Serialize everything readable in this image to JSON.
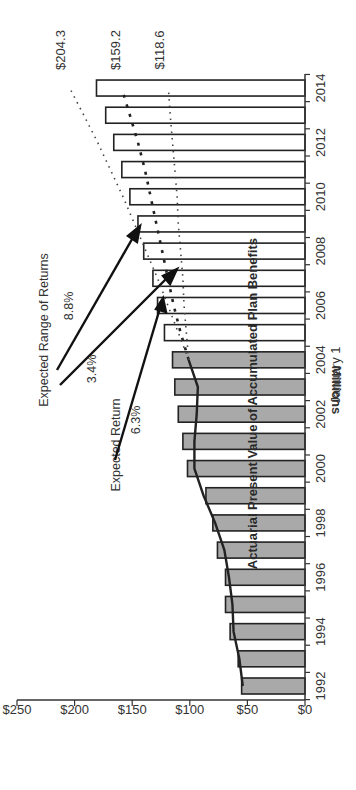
{
  "chart_data": {
    "type": "bar",
    "orientation": "rotated-90-ccw",
    "title": "",
    "xlabel": "January 1",
    "ylabel": "Millions",
    "ylim": [
      0,
      250
    ],
    "yticks": [
      "$0",
      "$50",
      "$100",
      "$150",
      "$200",
      "$250"
    ],
    "ytick_values": [
      0,
      50,
      100,
      150,
      200,
      250
    ],
    "xticks": [
      "1992",
      "1994",
      "1996",
      "1998",
      "2000",
      "2002",
      "2004",
      "2006",
      "2008",
      "2010",
      "2012",
      "2014"
    ],
    "categories": [
      1992,
      1993,
      1994,
      1995,
      1996,
      1997,
      1998,
      1999,
      2000,
      2001,
      2002,
      2003,
      2004,
      2005,
      2006,
      2007,
      2008,
      2009,
      2010,
      2011,
      2012,
      2013,
      2014
    ],
    "series": [
      {
        "name": "Assets (actual)",
        "style": "gray-filled-bar",
        "color": "#a9a9a9",
        "values": [
          55,
          58,
          65,
          69,
          69,
          76,
          80,
          86,
          102,
          106,
          110,
          113,
          115,
          null,
          null,
          null,
          null,
          null,
          null,
          null,
          null,
          null,
          null
        ]
      },
      {
        "name": "Assets (projected)",
        "style": "white-outline-bar",
        "color": "#ffffff",
        "values": [
          null,
          null,
          null,
          null,
          null,
          null,
          null,
          null,
          null,
          null,
          null,
          null,
          null,
          122,
          128,
          132,
          140,
          145,
          152,
          159,
          166,
          173,
          181
        ]
      },
      {
        "name": "Actuarial Present Value of Accumulated Plan Benefits",
        "style": "solid-line",
        "color": "#222222",
        "values": [
          54,
          57,
          62,
          63,
          66,
          70,
          78,
          88,
          96,
          96,
          94,
          93,
          101,
          null,
          null,
          null,
          null,
          null,
          null,
          null,
          null,
          null,
          null
        ]
      },
      {
        "name": "Expected Return 6.3%",
        "style": "dashed-line",
        "color": "#222222",
        "values": [
          null,
          null,
          null,
          null,
          null,
          null,
          null,
          null,
          null,
          null,
          null,
          null,
          101,
          108,
          114,
          119,
          124,
          129,
          134,
          139,
          145,
          152,
          159.2
        ]
      },
      {
        "name": "Expected Range of Returns 8.8%",
        "style": "dotted-line",
        "color": "#444444",
        "values": [
          null,
          null,
          null,
          null,
          null,
          null,
          null,
          null,
          null,
          null,
          null,
          null,
          101,
          110,
          119,
          128,
          138,
          148,
          158,
          169,
          180,
          192,
          204.3
        ]
      },
      {
        "name": "Expected Range of Returns 3.4%",
        "style": "dotted-line",
        "color": "#444444",
        "values": [
          null,
          null,
          null,
          null,
          null,
          null,
          null,
          null,
          null,
          null,
          null,
          null,
          101,
          103,
          105,
          106,
          108,
          110,
          111,
          113,
          115,
          117,
          118.6
        ]
      }
    ],
    "end_labels": [
      "$204.3",
      "$159.2",
      "$118.6"
    ],
    "annotations": [
      {
        "text": "Expected Range of Returns"
      },
      {
        "text": "8.8%"
      },
      {
        "text": "3.4%"
      },
      {
        "text": "Expected Return"
      },
      {
        "text": "6.3%"
      },
      {
        "text": "Actuarial Present Value of Accumulated Plan Benefits"
      }
    ],
    "grid": false,
    "legend": "none"
  },
  "labels": {
    "ylabel": "Millions",
    "xlabel": "January 1",
    "series_label": "Actuarial Present Value of Accumulated Plan Benefits",
    "range_title": "Expected Range of Returns",
    "range_high": "8.8%",
    "range_low": "3.4%",
    "expected_title": "Expected Return",
    "expected_rate": "6.3%",
    "end_high": "$204.3",
    "end_mid": "$159.2",
    "end_low": "$118.6"
  }
}
